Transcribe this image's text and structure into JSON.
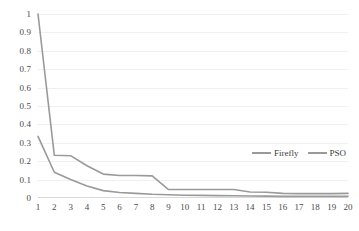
{
  "chart_data": {
    "type": "line",
    "title": "",
    "xlabel": "",
    "ylabel": "",
    "x": [
      1,
      2,
      3,
      4,
      5,
      6,
      7,
      8,
      9,
      10,
      11,
      12,
      13,
      14,
      15,
      16,
      17,
      18,
      19,
      20
    ],
    "xticklabels": [
      "1",
      "2",
      "3",
      "4",
      "5",
      "6",
      "7",
      "8",
      "9",
      "10",
      "11",
      "12",
      "13",
      "14",
      "15",
      "16",
      "17",
      "18",
      "19",
      "20"
    ],
    "yticklabels": [
      "0",
      "0.1",
      "0.2",
      "0.3",
      "0.4",
      "0.5",
      "0.6",
      "0.7",
      "0.8",
      "0.9",
      "1"
    ],
    "yticks": [
      0,
      0.1,
      0.2,
      0.3,
      0.4,
      0.5,
      0.6,
      0.7,
      0.8,
      0.9,
      1
    ],
    "xlim": [
      1,
      20
    ],
    "ylim": [
      0,
      1
    ],
    "grid": true,
    "grid_axis": "y",
    "legend_position": "inside-right",
    "series": [
      {
        "name": "Firefly",
        "color": "#9a9a9a",
        "values": [
          0.335,
          0.14,
          0.1,
          0.065,
          0.04,
          0.03,
          0.025,
          0.02,
          0.018,
          0.015,
          0.014,
          0.013,
          0.012,
          0.011,
          0.01,
          0.009,
          0.009,
          0.009,
          0.009,
          0.009
        ]
      },
      {
        "name": "PSO",
        "color": "#9a9a9a",
        "values": [
          1.0,
          0.232,
          0.23,
          0.175,
          0.13,
          0.122,
          0.122,
          0.12,
          0.046,
          0.046,
          0.046,
          0.046,
          0.046,
          0.033,
          0.031,
          0.025,
          0.024,
          0.024,
          0.024,
          0.025
        ]
      }
    ]
  },
  "legend": {
    "items": [
      {
        "label": "Firefly"
      },
      {
        "label": "PSO"
      }
    ]
  }
}
